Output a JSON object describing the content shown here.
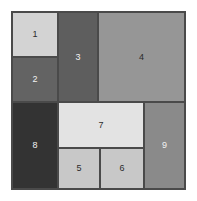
{
  "figure": {
    "kind": "treemap",
    "background_color": "#ffffff",
    "plot_border_color": "#4a4a4a",
    "tile_border_color": "#4a4a4a"
  },
  "chart_data": {
    "type": "treemap",
    "title": "",
    "subtitle": "",
    "xlabel": "",
    "ylabel": "",
    "grid": false,
    "legend": "none",
    "labels": [
      "1",
      "2",
      "3",
      "4",
      "5",
      "6",
      "7",
      "8",
      "9"
    ],
    "values": [
      8.1,
      7.6,
      19.3,
      36.2,
      9.9,
      9.9,
      18.5,
      20.2,
      17.2
    ],
    "tiles": [
      {
        "label": "1",
        "color": "#d3d3d3",
        "label_color": "#2b2b2b",
        "x": 0,
        "y": 0,
        "width": 46,
        "height": 45,
        "area_value": 8.1
      },
      {
        "label": "2",
        "color": "#636363",
        "label_color": "#f2f2f2",
        "x": 0,
        "y": 45,
        "width": 46,
        "height": 45,
        "area_value": 7.6
      },
      {
        "label": "3",
        "color": "#5e5e5e",
        "label_color": "#f2f2f2",
        "x": 46,
        "y": 0,
        "width": 40,
        "height": 90,
        "area_value": 19.3
      },
      {
        "label": "4",
        "color": "#969696",
        "label_color": "#2b2b2b",
        "x": 86,
        "y": 0,
        "width": 87,
        "height": 90,
        "area_value": 36.2
      },
      {
        "label": "8",
        "color": "#333333",
        "label_color": "#f2f2f2",
        "x": 0,
        "y": 90,
        "width": 46,
        "height": 87,
        "area_value": 20.2
      },
      {
        "label": "7",
        "color": "#e3e3e3",
        "label_color": "#2b2b2b",
        "x": 46,
        "y": 90,
        "width": 86,
        "height": 46,
        "area_value": 18.5
      },
      {
        "label": "5",
        "color": "#c8c8c8",
        "label_color": "#2b2b2b",
        "x": 46,
        "y": 136,
        "width": 42,
        "height": 41,
        "area_value": 9.9
      },
      {
        "label": "6",
        "color": "#c8c8c8",
        "label_color": "#2b2b2b",
        "x": 88,
        "y": 136,
        "width": 44,
        "height": 41,
        "area_value": 9.9
      },
      {
        "label": "9",
        "color": "#8a8a8a",
        "label_color": "#f2f2f2",
        "x": 132,
        "y": 90,
        "width": 41,
        "height": 87,
        "area_value": 17.2
      }
    ]
  }
}
